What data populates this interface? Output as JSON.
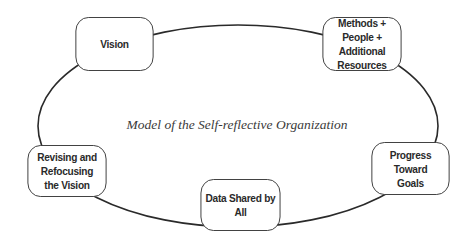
{
  "diagram": {
    "title": "Model of the Self-reflective Organization",
    "nodes": [
      {
        "id": "vision",
        "label": "Vision"
      },
      {
        "id": "methods",
        "label": "Methods + People + Additional Resources"
      },
      {
        "id": "progress",
        "label": "Progress Toward Goals"
      },
      {
        "id": "data",
        "label": "Data Shared by All"
      },
      {
        "id": "revising",
        "label": "Revising and Refocusing the Vision"
      }
    ],
    "edges": [
      [
        "vision",
        "methods"
      ],
      [
        "methods",
        "progress"
      ],
      [
        "progress",
        "data"
      ],
      [
        "data",
        "revising"
      ],
      [
        "revising",
        "vision"
      ]
    ],
    "colors": {
      "stroke": "#2a2a2a",
      "text": "#2a2a2a",
      "background": "#ffffff"
    }
  }
}
